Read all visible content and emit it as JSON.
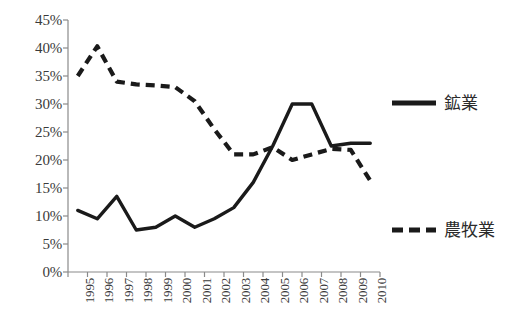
{
  "chart_data": {
    "type": "line",
    "title": "",
    "xlabel": "",
    "ylabel": "",
    "ylim": [
      0,
      45
    ],
    "ytick_step": 5,
    "ytick_labels": [
      "0%",
      "5%",
      "10%",
      "15%",
      "20%",
      "25%",
      "30%",
      "35%",
      "40%",
      "45%"
    ],
    "ytick_values": [
      0,
      5,
      10,
      15,
      20,
      25,
      30,
      35,
      40,
      45
    ],
    "grid": false,
    "legend_position": "right",
    "categories": [
      "1995",
      "1996",
      "1997",
      "1998",
      "1999",
      "2000",
      "2001",
      "2002",
      "2003",
      "2004",
      "2005",
      "2006",
      "2007",
      "2008",
      "2009",
      "2010"
    ],
    "series": [
      {
        "name": "鉱業",
        "style": "solid",
        "color": "#1a1a1a",
        "values": [
          11.0,
          9.5,
          13.5,
          7.5,
          8.0,
          10.0,
          8.0,
          9.5,
          11.5,
          16.0,
          22.5,
          30.0,
          30.0,
          22.5,
          23.0,
          23.0
        ]
      },
      {
        "name": "農牧業",
        "style": "dashed",
        "color": "#1a1a1a",
        "values": [
          35.0,
          40.3,
          34.0,
          33.5,
          33.3,
          33.0,
          30.5,
          25.5,
          21.0,
          21.0,
          22.3,
          20.0,
          21.0,
          22.0,
          21.8,
          16.3
        ]
      }
    ]
  },
  "legend": {
    "items": [
      {
        "label": "鉱業",
        "style": "solid"
      },
      {
        "label": "農牧業",
        "style": "dashed"
      }
    ]
  },
  "axis": {
    "y_label_0": "0%",
    "y_label_1": "5%",
    "y_label_2": "10%",
    "y_label_3": "15%",
    "y_label_4": "20%",
    "y_label_5": "25%",
    "y_label_6": "30%",
    "y_label_7": "35%",
    "y_label_8": "40%",
    "y_label_9": "45%"
  }
}
